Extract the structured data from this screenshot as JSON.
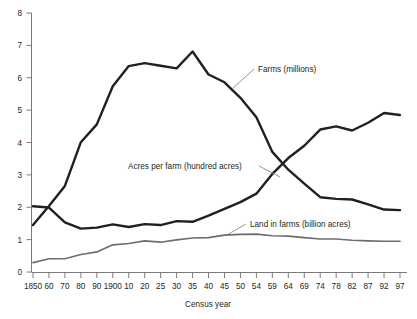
{
  "chart_data": {
    "type": "line",
    "title": "",
    "xlabel": "Census year",
    "ylabel": "",
    "ylim": [
      0,
      8
    ],
    "yticks": [
      0,
      1,
      2,
      3,
      4,
      5,
      6,
      7,
      8
    ],
    "grid": false,
    "legend_position": "inline-annotations",
    "categories": [
      "1850",
      "60",
      "70",
      "80",
      "90",
      "1900",
      "10",
      "20",
      "25",
      "30",
      "35",
      "40",
      "45",
      "50",
      "54",
      "59",
      "64",
      "69",
      "74",
      "78",
      "82",
      "87",
      "92",
      "97"
    ],
    "series": [
      {
        "name": "Farms (millions)",
        "color": "#231f20",
        "values": [
          1.45,
          2.04,
          2.66,
          4.01,
          4.56,
          5.74,
          6.36,
          6.45,
          6.37,
          6.29,
          6.81,
          6.1,
          5.86,
          5.38,
          4.78,
          3.71,
          3.16,
          2.73,
          2.31,
          2.26,
          2.24,
          2.09,
          1.93,
          1.91
        ]
      },
      {
        "name": "Acres per farm (hundred acres)",
        "color": "#231f20",
        "values": [
          2.03,
          1.99,
          1.53,
          1.34,
          1.37,
          1.47,
          1.39,
          1.48,
          1.45,
          1.57,
          1.55,
          1.74,
          1.95,
          2.16,
          2.42,
          3.03,
          3.52,
          3.9,
          4.4,
          4.5,
          4.37,
          4.61,
          4.91,
          4.85
        ]
      },
      {
        "name": "Land in farms (billion acres)",
        "color": "#6d6e71",
        "values": [
          0.29,
          0.41,
          0.41,
          0.54,
          0.62,
          0.84,
          0.88,
          0.96,
          0.92,
          0.99,
          1.05,
          1.06,
          1.14,
          1.16,
          1.17,
          1.12,
          1.11,
          1.06,
          1.02,
          1.02,
          0.98,
          0.96,
          0.95,
          0.95
        ]
      }
    ],
    "annotations": [
      {
        "text": "Farms (millions)",
        "label_x": 258,
        "label_y": 69,
        "leader_from_x": 254,
        "leader_from_y": 69,
        "leader_to_x": 233,
        "leader_to_y": 88
      },
      {
        "text": "Acres per farm (hundred acres)",
        "label_x": 128,
        "label_y": 166,
        "leader_from_x": 259,
        "leader_from_y": 166,
        "leader_to_x": 280,
        "leader_to_y": 177
      },
      {
        "text": "Land in farms (billion acres)",
        "label_x": 250,
        "label_y": 224,
        "leader_from_x": 246,
        "leader_from_y": 224,
        "leader_to_x": 225,
        "leader_to_y": 236
      }
    ]
  },
  "axis": {
    "x_title": "Census year",
    "y_tick_labels": [
      "8",
      "7",
      "6",
      "5",
      "4",
      "3",
      "2",
      "1",
      "0"
    ],
    "x_tick_labels": [
      "1850",
      "60",
      "70",
      "80",
      "90",
      "1900",
      "10",
      "20",
      "25",
      "30",
      "35",
      "40",
      "45",
      "50",
      "54",
      "59",
      "64",
      "69",
      "74",
      "78",
      "82",
      "87",
      "92",
      "97"
    ]
  },
  "colors": {
    "ink": "#231f20",
    "gray_series": "#6d6e71",
    "axis": "#7a7a7a",
    "background": "#ffffff"
  }
}
